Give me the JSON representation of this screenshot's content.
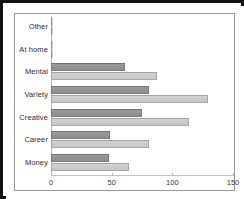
{
  "chart_data": {
    "type": "bar",
    "orientation": "horizontal",
    "title": "",
    "xlabel": "",
    "ylabel": "",
    "xlim": [
      0,
      150
    ],
    "xticks": [
      0,
      50,
      100,
      150
    ],
    "xtick_labels": [
      "0",
      "50",
      "100",
      "150"
    ],
    "grid": false,
    "legend": "none",
    "categories": [
      "Other",
      "At home",
      "Mental",
      "Variety",
      "Creative",
      "Career",
      "Money"
    ],
    "series": [
      {
        "name": "series-1",
        "color": "#8d8d8d",
        "values": [
          1,
          2,
          61,
          81,
          75,
          49,
          48
        ]
      },
      {
        "name": "series-2",
        "color": "#c6c6c6",
        "values": [
          1,
          2,
          87,
          129,
          114,
          81,
          64
        ]
      }
    ]
  },
  "colors": {
    "frame": "#111111",
    "plot_border": "#9a9a9a",
    "axis": "#b5b5b5",
    "series_1": "#8d8d8d",
    "series_2": "#c6c6c6",
    "label_text": "#2e2e2e",
    "tick_text": "#3a3a3a",
    "background": "#ffffff"
  }
}
